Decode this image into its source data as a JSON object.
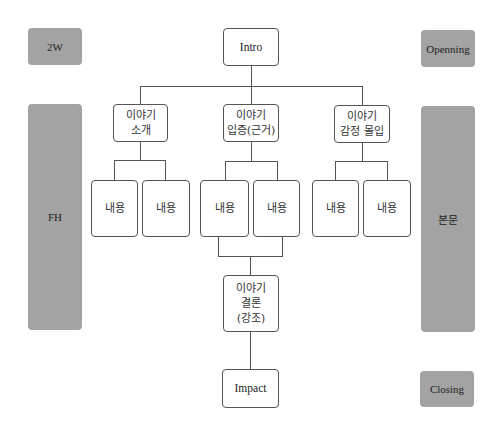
{
  "side_labels": {
    "left": [
      {
        "label": "2W"
      },
      {
        "label": "FH"
      }
    ],
    "right": [
      {
        "label": "Openning"
      },
      {
        "label": "본문"
      },
      {
        "label": "Closing"
      }
    ]
  },
  "tree": {
    "root": {
      "label": "Intro"
    },
    "branches": [
      {
        "line1": "이야기",
        "line2": "소개",
        "children": [
          "내용",
          "내용"
        ]
      },
      {
        "line1": "이야기",
        "line2": "입증(근거)",
        "children": [
          "내용",
          "내용"
        ]
      },
      {
        "line1": "이야기",
        "line2": "감정 몰입",
        "children": [
          "내용",
          "내용"
        ]
      }
    ],
    "conclusion": {
      "line1": "이야기",
      "line2": "결론",
      "line3": "(강조)"
    },
    "end": {
      "label": "Impact"
    }
  },
  "colors": {
    "side_fill": "#a3a3a3",
    "line": "#555555",
    "node_border": "#555555"
  }
}
